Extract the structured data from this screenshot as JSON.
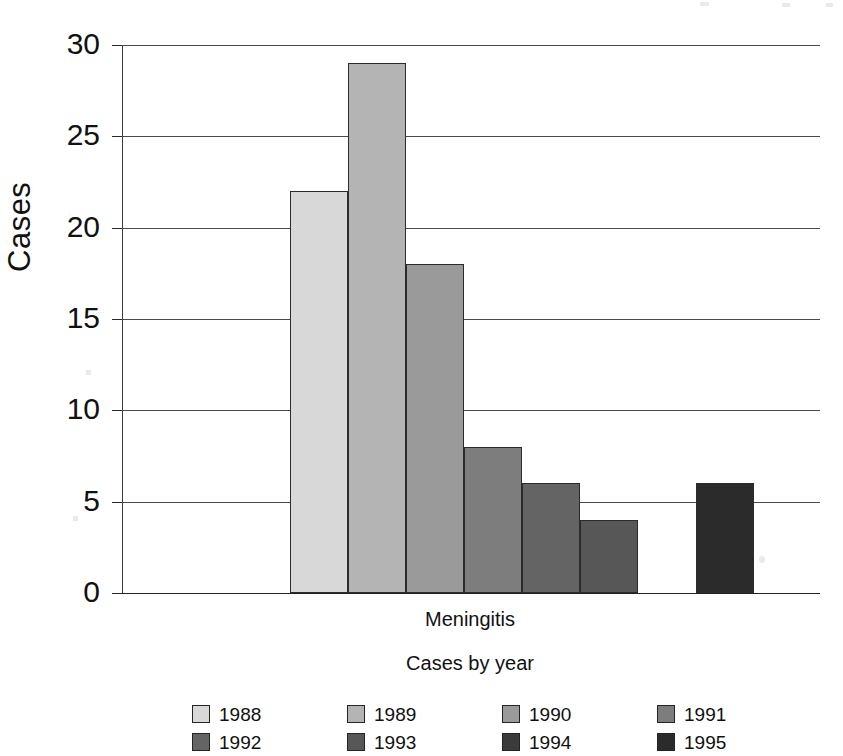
{
  "chart_data": {
    "type": "bar",
    "title": "",
    "subtitle": "",
    "categories": [
      "Meningitis"
    ],
    "category_label": "Meningitis",
    "xlabel": "Cases by year",
    "ylabel": "Cases",
    "ylim": [
      0,
      30
    ],
    "ytick_labels": [
      "30",
      "25",
      "20",
      "15",
      "10",
      "5",
      "0"
    ],
    "ytick_values": [
      30,
      25,
      20,
      15,
      10,
      5,
      0
    ],
    "grid": true,
    "legend_position": "bottom",
    "series": [
      {
        "name": "1988",
        "values": [
          22
        ],
        "color": "#d8d8d8"
      },
      {
        "name": "1989",
        "values": [
          29
        ],
        "color": "#b4b4b4"
      },
      {
        "name": "1990",
        "values": [
          18
        ],
        "color": "#9a9a9a"
      },
      {
        "name": "1991",
        "values": [
          8
        ],
        "color": "#7d7d7d"
      },
      {
        "name": "1992",
        "values": [
          6
        ],
        "color": "#646464"
      },
      {
        "name": "1993",
        "values": [
          4
        ],
        "color": "#575757"
      },
      {
        "name": "1994",
        "values": [
          0
        ],
        "color": "#3b3b3b"
      },
      {
        "name": "1995",
        "values": [
          6
        ],
        "color": "#2b2b2b"
      }
    ]
  },
  "axis": {
    "y_title": "Cases",
    "x_title": "Cases by year",
    "category": "Meningitis"
  },
  "legend": {
    "entries": [
      {
        "label": "1988",
        "color": "#d8d8d8"
      },
      {
        "label": "1989",
        "color": "#b4b4b4"
      },
      {
        "label": "1990",
        "color": "#9a9a9a"
      },
      {
        "label": "1991",
        "color": "#7d7d7d"
      },
      {
        "label": "1992",
        "color": "#646464"
      },
      {
        "label": "1993",
        "color": "#575757"
      },
      {
        "label": "1994",
        "color": "#3b3b3b"
      },
      {
        "label": "1995",
        "color": "#2b2b2b"
      }
    ]
  }
}
